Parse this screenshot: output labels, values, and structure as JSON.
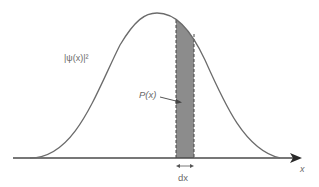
{
  "diagram": {
    "labels": {
      "density": "|ψ(x)|²",
      "probability": "P(x)",
      "interval": "dx",
      "axis": "x"
    },
    "colors": {
      "curve": "#6b6b6b",
      "axis": "#4a4a4a",
      "shade": "#8c8c8c",
      "text": "#6a6a6a"
    },
    "geometry": {
      "axis_y": 158,
      "axis_x_start": 13,
      "axis_x_end": 300,
      "peak_x": 157,
      "peak_y": 13,
      "strip_x0": 176,
      "strip_x1": 194
    }
  }
}
